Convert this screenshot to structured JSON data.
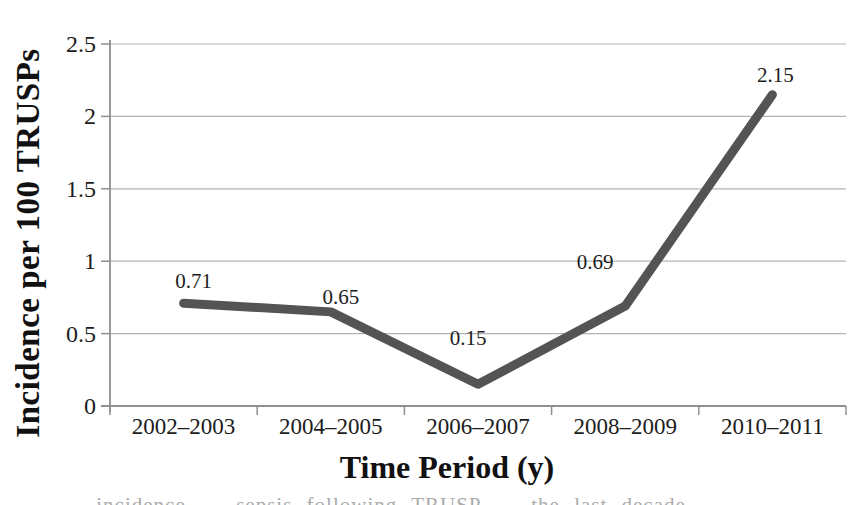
{
  "chart_data": {
    "type": "line",
    "title": "",
    "xlabel": "Time Period (y)",
    "ylabel": "Incidence per 100 TRUSPs",
    "categories": [
      "2002–2003",
      "2004–2005",
      "2006–2007",
      "2008–2009",
      "2010–2011"
    ],
    "series": [
      {
        "name": "Incidence per 100 TRUSPs",
        "values": [
          0.71,
          0.65,
          0.15,
          0.69,
          2.15
        ]
      }
    ],
    "data_labels": [
      "0.71",
      "0.65",
      "0.15",
      "0.69",
      "2.15"
    ],
    "ylim": [
      0,
      2.5
    ],
    "yticks": [
      "0",
      "0.5",
      "1",
      "1.5",
      "2",
      "2.5"
    ],
    "ytick_interval": 0.5,
    "grid": "horizontal",
    "legend": "none",
    "styles": {
      "line_color": "#545454",
      "gridline_color": "#b3b3b3",
      "axis_color": "#8f8f8f",
      "text_color": "#1c1c1c",
      "background": "#ffffff"
    }
  },
  "caption": {
    "clipped_text_fragment": "… incidence … sepsis following TRUSP … the last decade …"
  }
}
